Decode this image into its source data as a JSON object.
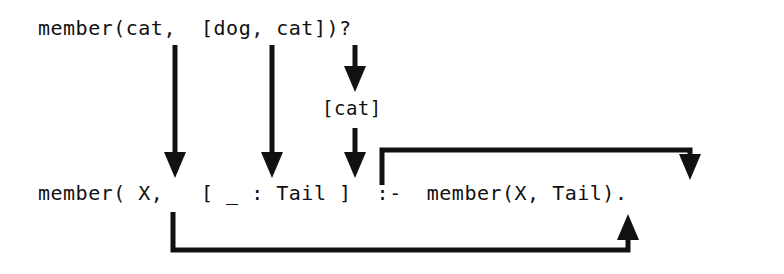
{
  "diagram": {
    "background_color": "#ffffff",
    "ink_color": "#111111",
    "query": {
      "text": "member(cat,  [dog, cat])?"
    },
    "clause": {
      "text": "member( X,   [ _ : Tail ]  :-  member(X, Tail)."
    },
    "binding": {
      "text": "[cat]"
    },
    "arrows": [
      {
        "name": "arrow-cat-to-x",
        "label": "cat binds to X",
        "from": "cat (query argument 1)",
        "to": "X (clause head argument 1)",
        "direction": "down"
      },
      {
        "name": "arrow-list-to-pattern",
        "label": "[dog, cat] binds to [ _ : Tail ]",
        "from": "[dog, cat] (query argument 2)",
        "to": "[ (clause list pattern)",
        "direction": "down"
      },
      {
        "name": "arrow-tail-binding",
        "label": "tail of list binds to Tail",
        "from": "cat] (query list tail)",
        "to": "Tail (clause list pattern)",
        "direction": "down",
        "via": "[cat]"
      },
      {
        "name": "arrow-tail-to-recursive-call",
        "label": "Tail passed into recursive call",
        "from": "Tail (clause head)",
        "to": "Tail (recursive body call)",
        "direction": "right-then-down"
      },
      {
        "name": "arrow-x-to-recursive-call",
        "label": "X passed into recursive call",
        "from": "X (clause head)",
        "to": "X (recursive body call)",
        "direction": "down-then-right-then-up"
      }
    ]
  }
}
